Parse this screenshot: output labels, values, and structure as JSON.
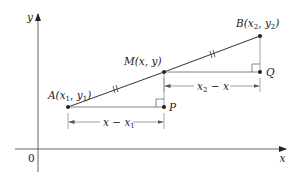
{
  "diagram": {
    "colors": {
      "ink": "#333333",
      "axis": "#555555",
      "guide": "#8a8a8a",
      "background": "#ffffff"
    },
    "axes": {
      "x_label": "x",
      "y_label": "y",
      "origin_label": "0"
    },
    "points": [
      {
        "id": "A",
        "name": "A",
        "coords": "(x1, y1)",
        "label_parts": [
          "A(",
          "x",
          "1",
          ", ",
          "y",
          "1",
          ")"
        ],
        "px": [
          68,
          107
        ]
      },
      {
        "id": "M",
        "name": "M",
        "coords": "(x, y)",
        "label": "M(x, y)",
        "px": [
          164,
          72
        ]
      },
      {
        "id": "B",
        "name": "B",
        "coords": "(x2, y2)",
        "label_parts": [
          "B(",
          "x",
          "2",
          ", ",
          "y",
          "2",
          ")"
        ],
        "px": [
          260,
          36
        ]
      },
      {
        "id": "P",
        "name": "P",
        "label": "P",
        "px": [
          164,
          107
        ]
      },
      {
        "id": "Q",
        "name": "Q",
        "label": "Q",
        "px": [
          260,
          72
        ]
      }
    ],
    "segments": [
      {
        "from": "A",
        "to": "M",
        "congruence_mark": "//"
      },
      {
        "from": "M",
        "to": "B",
        "congruence_mark": "//"
      },
      {
        "from": "A",
        "to": "P",
        "type": "horizontal leg"
      },
      {
        "from": "M",
        "to": "P",
        "type": "vertical leg"
      },
      {
        "from": "M",
        "to": "Q",
        "type": "horizontal leg"
      },
      {
        "from": "B",
        "to": "Q",
        "type": "vertical leg"
      }
    ],
    "right_angles": [
      "P",
      "Q"
    ],
    "dimensions": [
      {
        "id": "x-minus-x1",
        "label_parts": [
          "x",
          " − ",
          "x",
          "1"
        ],
        "text": "x − x1"
      },
      {
        "id": "x2-minus-x",
        "label_parts": [
          "x",
          "2",
          " − ",
          "x"
        ],
        "text": "x2 − x"
      }
    ]
  }
}
